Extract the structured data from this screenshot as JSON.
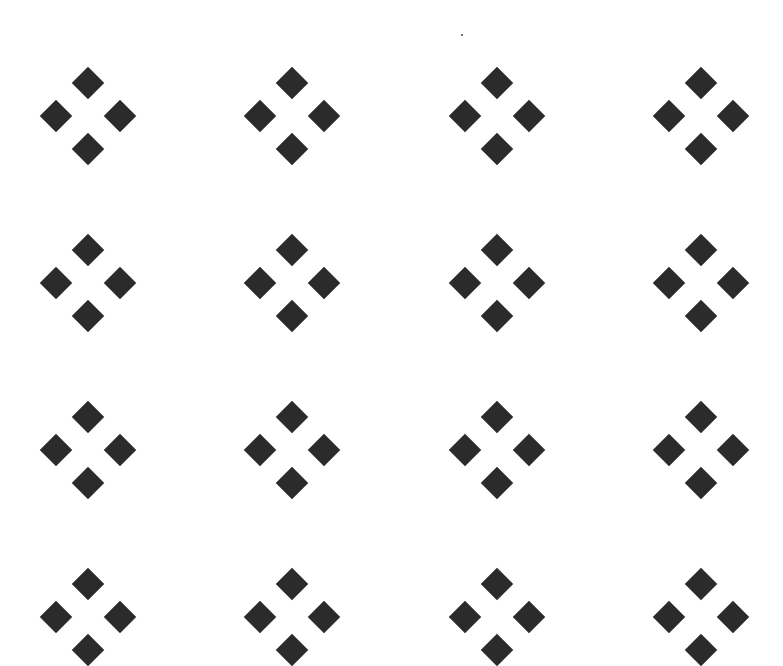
{
  "pattern": {
    "type": "tiled-diamond-clusters",
    "background": "#ffffff",
    "diamond_color": "#2b2b2b",
    "columns": 4,
    "rows_visible": 4,
    "column_centers_x": [
      88,
      292,
      497,
      701
    ],
    "row_centers_y": [
      116,
      283,
      450,
      617
    ],
    "cluster_shape": "four diamonds arranged top/left/right/bottom",
    "diamond_size_px": 32
  },
  "artifact": {
    "type": "speck",
    "x": 461,
    "y": 35
  }
}
